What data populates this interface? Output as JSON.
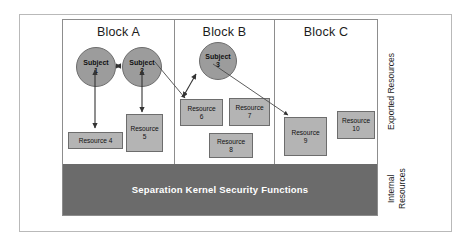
{
  "blocks": [
    {
      "id": "a",
      "label": "Block A"
    },
    {
      "id": "b",
      "label": "Block B"
    },
    {
      "id": "c",
      "label": "Block C"
    }
  ],
  "subjects": [
    {
      "id": "subject-1",
      "line1": "Subject",
      "line2": "1",
      "block": "a"
    },
    {
      "id": "subject-2",
      "line1": "Subject",
      "line2": "2",
      "block": "a"
    },
    {
      "id": "subject-3",
      "line1": "Subject",
      "line2": "3",
      "block": "b"
    }
  ],
  "resources": [
    {
      "id": "resource-4",
      "line1": "Resource 4",
      "line2": "",
      "block": "a"
    },
    {
      "id": "resource-5",
      "line1": "Resource",
      "line2": "5",
      "block": "a"
    },
    {
      "id": "resource-6",
      "line1": "Resource",
      "line2": "6",
      "block": "b"
    },
    {
      "id": "resource-7",
      "line1": "Resource",
      "line2": "7",
      "block": "b"
    },
    {
      "id": "resource-8",
      "line1": "Resource",
      "line2": "8",
      "block": "b"
    },
    {
      "id": "resource-9",
      "line1": "Resource",
      "line2": "9",
      "block": "c"
    },
    {
      "id": "resource-10",
      "line1": "Resource",
      "line2": "10",
      "block": "c"
    }
  ],
  "kernel": {
    "label": "Separation Kernel Security Functions"
  },
  "side_labels": {
    "exported": "Exported Resources",
    "internal": "Internal\nResources"
  },
  "colors": {
    "subject_fill": "#9c9c9c",
    "resource_fill": "#b4b4b4",
    "kernel_fill": "#6b6b6b",
    "kernel_text": "#ffffff",
    "stroke": "#6d6d6d",
    "frame": "#b9b9b9",
    "background": "#ffffff"
  },
  "connections": [
    {
      "from": "subject-1",
      "to": "subject-2",
      "type": "bidirectional"
    },
    {
      "from": "subject-1",
      "to": "resource-4",
      "type": "bidirectional"
    },
    {
      "from": "subject-2",
      "to": "resource-5",
      "type": "bidirectional"
    },
    {
      "from": "subject-2",
      "to": "resource-6",
      "type": "directional"
    },
    {
      "from": "subject-3",
      "to": "resource-6",
      "type": "bidirectional"
    },
    {
      "from": "subject-3",
      "to": "resource-9",
      "type": "directional"
    }
  ]
}
